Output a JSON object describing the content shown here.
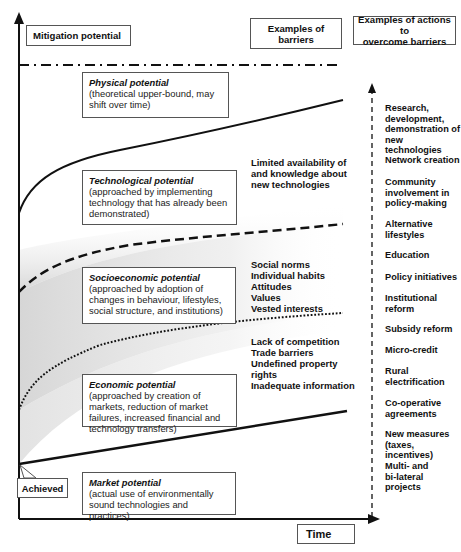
{
  "headers": {
    "mitigation": "Mitigation potential",
    "barriers": "Examples of\nbarriers",
    "actions": "Examples of actions to\novercome barriers"
  },
  "potentials": [
    {
      "title": "Physical potential",
      "desc": "(theoretical upper-bound, may shift over time)"
    },
    {
      "title": "Technological potential",
      "desc": "(approached by implementing technology that has already been demonstrated)"
    },
    {
      "title": "Socioeconomic potential",
      "desc": "(approached by adoption of changes in behaviour, lifestyles, social structure, and institutions)"
    },
    {
      "title": "Economic potential",
      "desc": "(approached by creation of markets, reduction of market failures, increased financial and technology transfers)"
    },
    {
      "title": "Market potential",
      "desc": "(actual use of environmentally sound technologies and practices)"
    }
  ],
  "barriers": [
    "Limited availability of\nand knowledge about\nnew technologies",
    "Social norms\nIndividual habits\nAttitudes\nValues\nVested interests",
    "Lack of competition\nTrade barriers\nUndefined property\nrights\nInadequate information"
  ],
  "actions": [
    "Research,\ndevelopment,\ndemonstration of\nnew technologies",
    "Network creation",
    "Community\ninvolvement in\npolicy-making",
    "Alternative\nlifestyles",
    "Education",
    "Policy initiatives",
    "Institutional\nreform",
    "Subsidy reform",
    "Micro-credit",
    "Rural\nelectrification",
    "Co-operative\nagreements",
    "New measures\n(taxes, incentives)",
    "Multi- and\nbi-lateral projects"
  ],
  "labels": {
    "achieved": "Achieved",
    "time": "Time"
  },
  "colors": {
    "line": "#111111",
    "shade": "#cfcfcf",
    "box_border": "#555555"
  }
}
